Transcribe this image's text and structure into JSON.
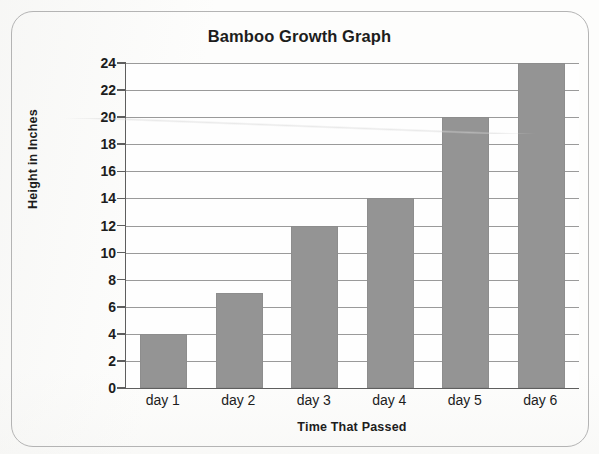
{
  "frame": {
    "border_color": "#b4b4b4"
  },
  "chart_data": {
    "type": "bar",
    "title": "Bamboo Growth Graph",
    "xlabel": "Time That Passed",
    "ylabel": "Height in Inches",
    "categories": [
      "day 1",
      "day 2",
      "day 3",
      "day 4",
      "day 5",
      "day 6"
    ],
    "values": [
      4,
      7,
      12,
      14,
      20,
      24
    ],
    "ylim": [
      0,
      24
    ],
    "ytick_step": 2,
    "yticks": [
      0,
      2,
      4,
      6,
      8,
      10,
      12,
      14,
      16,
      18,
      20,
      22,
      24
    ],
    "ytick_labels": [
      "0",
      "2",
      "4",
      "6",
      "8",
      "10",
      "12",
      "14",
      "16",
      "18",
      "20",
      "22",
      "24"
    ],
    "grid": true,
    "grid_axis": "y",
    "legend": false,
    "bar_color": "#949494",
    "grid_color": "#9a9a9a",
    "axis_color": "#5e5e5e",
    "text_color": "#1d1d1d",
    "background_color": "#fefefe"
  }
}
